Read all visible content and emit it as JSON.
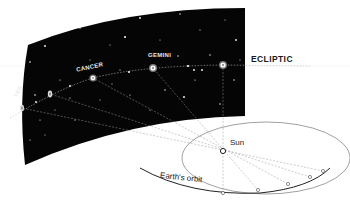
{
  "diagram": {
    "type": "celestial-sphere-ecliptic",
    "labels": {
      "ecliptic": "ECLIPTIC",
      "sun": "Sun",
      "earth_orbit": "Earth's orbit"
    },
    "constellations": [
      {
        "name": "LEO",
        "x": 22,
        "y": 108
      },
      {
        "name": "CANCER",
        "x": 93,
        "y": 78
      },
      {
        "name": "GEMINI",
        "x": 153,
        "y": 68
      }
    ],
    "colors": {
      "sky": "#050505",
      "background": "#ffffff",
      "lines": "#9a9a9a",
      "orbit": "#333333",
      "text": "#1a1a1a",
      "sky_text": "#e8e8e8"
    }
  }
}
